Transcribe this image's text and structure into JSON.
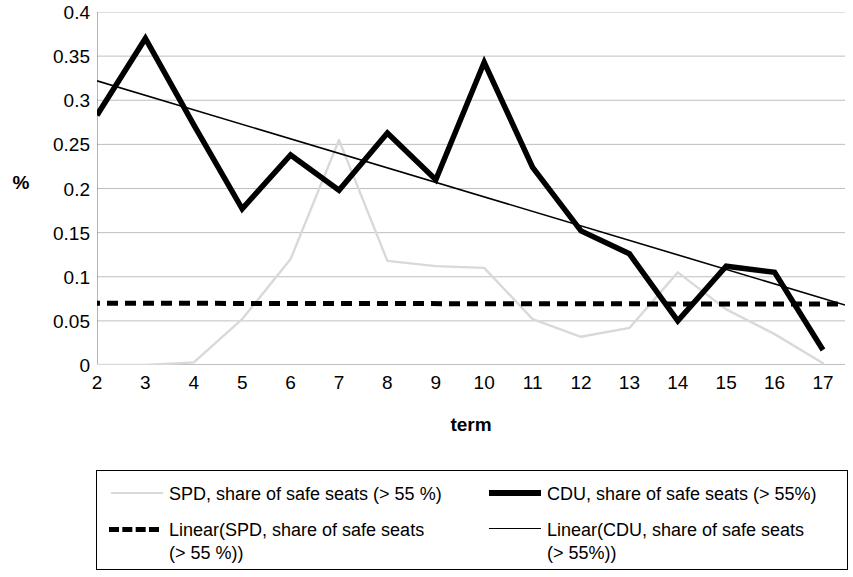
{
  "chart_data": {
    "type": "line",
    "title": "",
    "xlabel": "term",
    "ylabel": "%",
    "xlim": [
      2,
      17
    ],
    "ylim": [
      0,
      0.4
    ],
    "grid": true,
    "legend_position": "bottom",
    "x": [
      2,
      3,
      4,
      5,
      6,
      7,
      8,
      9,
      10,
      11,
      12,
      13,
      14,
      15,
      16,
      17
    ],
    "x_tick_labels": [
      "2",
      "3",
      "4",
      "5",
      "6",
      "7",
      "8",
      "9",
      "10",
      "11",
      "12",
      "13",
      "14",
      "15",
      "16",
      "17"
    ],
    "y_tick_labels": [
      "0.4",
      "0.35",
      "0.3",
      "0.25",
      "0.2",
      "0.15",
      "0.1",
      "0.05",
      "0"
    ],
    "y_ticks": [
      0.4,
      0.35,
      0.3,
      0.25,
      0.2,
      0.15,
      0.1,
      0.05,
      0
    ],
    "series": [
      {
        "name": "SPD, share of safe seats (> 55 %)",
        "style": "solid-thin-gray",
        "color": "#d9d9d9",
        "values": [
          0,
          0,
          0.003,
          0.052,
          0.12,
          0.255,
          0.118,
          0.112,
          0.11,
          0.052,
          0.032,
          0.042,
          0.105,
          0.063,
          0.035,
          0.002
        ]
      },
      {
        "name": "CDU, share of safe seats (> 55%)",
        "style": "solid-thick-black",
        "color": "#000000",
        "values": [
          0.283,
          0.37,
          0.272,
          0.177,
          0.238,
          0.198,
          0.263,
          0.21,
          0.343,
          0.224,
          0.152,
          0.126,
          0.05,
          0.112,
          0.105,
          0.017
        ]
      },
      {
        "name": "Linear(SPD, share of safe seats (> 55 %))",
        "style": "dashed-black",
        "color": "#000000",
        "trend": true,
        "endpoints": [
          0.07,
          0.069
        ]
      },
      {
        "name": "Linear(CDU, share of safe seats (> 55%))",
        "style": "solid-thin-black",
        "color": "#000000",
        "trend": true,
        "endpoints": [
          0.322,
          0.068
        ]
      }
    ]
  },
  "axes": {
    "y_title": "%",
    "x_title": "term"
  },
  "legend": {
    "entries": [
      {
        "label": "SPD, share of safe seats (> 55 %)",
        "marker": "spd-line-marker"
      },
      {
        "label": "CDU, share of safe seats (> 55%)",
        "marker": "cdu-line-marker"
      },
      {
        "label": "Linear(SPD, share of safe seats\n(> 55 %))",
        "marker": "spd-trend-marker"
      },
      {
        "label": "Linear(CDU, share of safe seats\n(> 55%))",
        "marker": "cdu-trend-marker"
      }
    ]
  },
  "colors": {
    "spd": "#d9d9d9",
    "cdu": "#000000",
    "grid": "#bfbfbf",
    "axis": "#808080",
    "background": "#ffffff"
  }
}
